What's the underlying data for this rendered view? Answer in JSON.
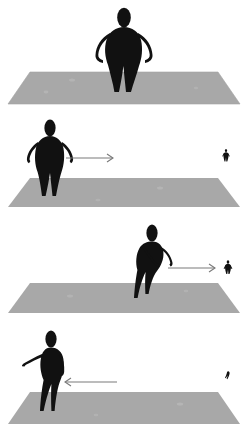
{
  "scene": {
    "title": "Four-panel silhouette motion sequence",
    "canvas_width": 247,
    "canvas_height": 439,
    "background_color": "#ffffff",
    "ground_color": "#a8a8a8",
    "ground_shadow_color": "#9b9b9b",
    "figure_color": "#111111",
    "arrow_color": "#7a7a7a"
  },
  "panels": [
    {
      "id": "panel-1",
      "index": 1,
      "label": "Panel 1 - standing still, hands on hips",
      "top": 0,
      "height": 110,
      "ground": {
        "label": "ground-plane",
        "top_y": 72,
        "bottom_y": 104,
        "top_left_x": 30,
        "top_right_x": 218,
        "bottom_left_x": 8,
        "bottom_right_x": 240
      },
      "actor": {
        "label": "main-figure",
        "pose": "standing-hands-on-hips",
        "center_x": 124,
        "head_top_y": 8,
        "feet_y": 92,
        "scale": 1.0,
        "facing": "front"
      },
      "arrow": null,
      "distant_figure": null
    },
    {
      "id": "panel-2",
      "index": 2,
      "label": "Panel 2 - walking, arrow points right toward distant figure",
      "top": 110,
      "height": 105,
      "ground": {
        "label": "ground-plane",
        "top_y": 178,
        "bottom_y": 207,
        "top_left_x": 30,
        "top_right_x": 218,
        "bottom_left_x": 8,
        "bottom_right_x": 240
      },
      "actor": {
        "label": "main-figure",
        "pose": "walking-forward",
        "center_x": 50,
        "head_top_y": 120,
        "feet_y": 196,
        "scale": 0.92,
        "facing": "front"
      },
      "arrow": {
        "label": "motion-arrow-right",
        "direction": "right",
        "x1": 66,
        "x2": 113,
        "y": 158
      },
      "distant_figure": {
        "label": "distant-figure",
        "x": 226,
        "y": 150,
        "scale": 0.14
      }
    },
    {
      "id": "panel-3",
      "index": 3,
      "label": "Panel 3 - reaching forward, arrow points right toward distant figure",
      "top": 215,
      "height": 105,
      "ground": {
        "label": "ground-plane",
        "top_y": 283,
        "bottom_y": 313,
        "top_left_x": 30,
        "top_right_x": 218,
        "bottom_left_x": 8,
        "bottom_right_x": 240
      },
      "actor": {
        "label": "main-figure",
        "pose": "reaching-forward-striding",
        "center_x": 150,
        "head_top_y": 224,
        "feet_y": 302,
        "scale": 0.97,
        "facing": "right"
      },
      "arrow": {
        "label": "motion-arrow-right",
        "direction": "right",
        "x1": 168,
        "x2": 215,
        "y": 268
      },
      "distant_figure": {
        "label": "distant-figure",
        "x": 228,
        "y": 262,
        "scale": 0.16
      }
    },
    {
      "id": "panel-4",
      "index": 4,
      "label": "Panel 4 - turning away, arrow points left",
      "top": 320,
      "height": 119,
      "ground": {
        "label": "ground-plane",
        "top_y": 392,
        "bottom_y": 424,
        "top_left_x": 30,
        "top_right_x": 218,
        "bottom_left_x": 8,
        "bottom_right_x": 240
      },
      "actor": {
        "label": "main-figure",
        "pose": "walking-away-arm-back",
        "center_x": 50,
        "head_top_y": 330,
        "feet_y": 412,
        "scale": 0.95,
        "facing": "left"
      },
      "arrow": {
        "label": "motion-arrow-left",
        "direction": "left",
        "x1": 65,
        "x2": 117,
        "y": 382
      },
      "distant_figure": {
        "label": "distant-figure",
        "x": 228,
        "y": 373,
        "scale": 0.11
      }
    }
  ]
}
